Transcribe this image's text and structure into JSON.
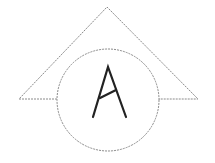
{
  "diagram": {
    "shapes": {
      "triangle": {
        "points": [
          [
            107,
            7
          ],
          [
            19,
            99
          ],
          [
            198,
            99
          ]
        ],
        "stroke": "#8a8a8a",
        "style": "dashed"
      },
      "circle": {
        "cx": 108,
        "cy": 100,
        "r": 51,
        "stroke": "#8a8a8a",
        "style": "dashed"
      }
    },
    "letter": {
      "text": "A",
      "color": "#222222"
    }
  }
}
